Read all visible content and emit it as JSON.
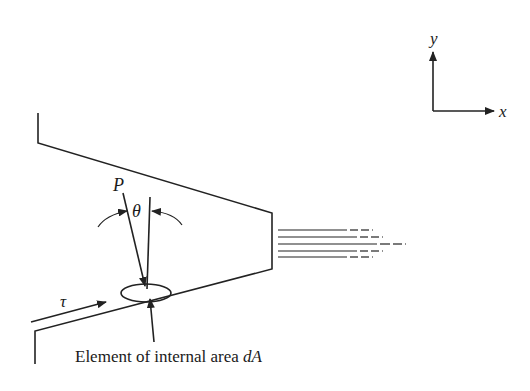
{
  "diagram": {
    "type": "nozzle-jet-force-diagram",
    "axes": {
      "x_label": "x",
      "y_label": "y"
    },
    "labels": {
      "pressure": "P",
      "angle": "θ",
      "shear_stress": "τ",
      "caption_prefix": "Element of internal area ",
      "caption_symbol": "dA"
    },
    "streamlines_count": 5,
    "colors": {
      "line": "#222222",
      "background": "#ffffff"
    }
  }
}
